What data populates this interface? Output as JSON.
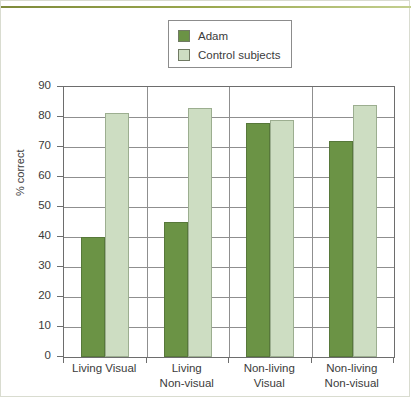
{
  "figure": {
    "ylabel": "% correct",
    "legend": {
      "position": "top-center",
      "entries": [
        {
          "label": "Adam",
          "color": "#6b9345",
          "swatch": "adam"
        },
        {
          "label": "Control subjects",
          "color": "#cdddc2",
          "swatch": "control"
        }
      ]
    },
    "accent_rule_color": "#9aa84e",
    "frame_color": "#6d6d6d",
    "grid_color": "#8f8f8f"
  },
  "chart_data": {
    "type": "bar",
    "title": "",
    "xlabel": "",
    "ylabel": "% correct",
    "ylim": [
      0,
      90
    ],
    "yticks": [
      0,
      10,
      20,
      30,
      40,
      50,
      60,
      70,
      80,
      90
    ],
    "ytick_labels": [
      "0",
      "10",
      "20",
      "30",
      "40",
      "50",
      "60",
      "70",
      "80",
      "90"
    ],
    "grid": true,
    "legend_position": "top-center",
    "categories": [
      "Living Visual",
      "Living Non-visual",
      "Non-living Visual",
      "Non-living Non-visual"
    ],
    "category_lines": [
      [
        "Living Visual",
        ""
      ],
      [
        "Living",
        "Non-visual"
      ],
      [
        "Non-living",
        "Visual"
      ],
      [
        "Non-living",
        "Non-visual"
      ]
    ],
    "series": [
      {
        "name": "Adam",
        "color": "#6b9345",
        "values": [
          40,
          45,
          78,
          72
        ]
      },
      {
        "name": "Control subjects",
        "color": "#cdddc2",
        "values": [
          81.5,
          83,
          79,
          84
        ]
      }
    ]
  }
}
